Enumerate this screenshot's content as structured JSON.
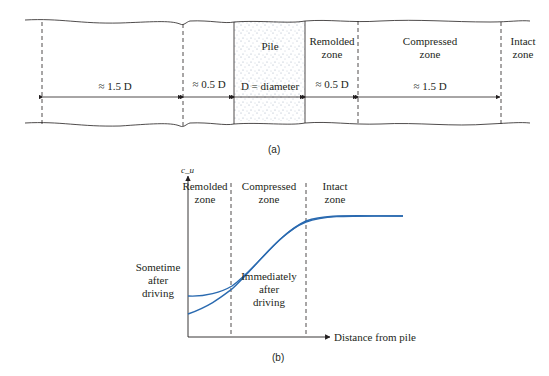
{
  "figure_a": {
    "caption": "(a)",
    "pile_label": "Pile",
    "pile_dim_label": "D = diameter",
    "zones": [
      {
        "name": "Remolded",
        "line2": "zone",
        "width_label": "≈ 0.5 D"
      },
      {
        "name": "Compressed",
        "line2": "zone",
        "width_label": "≈ 1.5 D"
      },
      {
        "name": "Intact",
        "line2": "zone"
      }
    ],
    "left_dims": [
      {
        "label": "≈ 1.5 D"
      },
      {
        "label": "≈ 0.5 D"
      }
    ],
    "colors": {
      "line": "#231f20",
      "stipple": "#8a9ab0"
    }
  },
  "figure_b": {
    "caption": "(b)",
    "y_axis_label": "c_u",
    "x_axis_label": "Distance from pile",
    "zones": [
      {
        "name": "Remolded",
        "line2": "zone"
      },
      {
        "name": "Compressed",
        "line2": "zone"
      },
      {
        "name": "Intact",
        "line2": "zone"
      }
    ],
    "curves": [
      {
        "label_lines": [
          "Sometime",
          "after",
          "driving"
        ]
      },
      {
        "label_lines": [
          "Immediately",
          "after",
          "driving"
        ]
      }
    ],
    "colors": {
      "curve": "#2a6ab0",
      "axis": "#231f20"
    }
  }
}
